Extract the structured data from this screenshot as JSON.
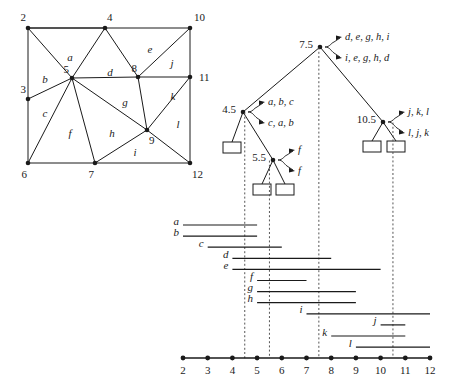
{
  "chart_data": {
    "type": "diagram",
    "xlabel": "",
    "ylabel": "",
    "axis": {
      "min": 2,
      "max": 12,
      "ticks": [
        2,
        3,
        4,
        5,
        6,
        7,
        8,
        9,
        10,
        11,
        12
      ],
      "tick_labels": [
        "2",
        "3",
        "4",
        "5",
        "6",
        "7",
        "8",
        "9",
        "10",
        "11",
        "12"
      ]
    },
    "intervals": [
      {
        "name": "a",
        "start": 2,
        "end": 5,
        "label_side": "left"
      },
      {
        "name": "b",
        "start": 2,
        "end": 5,
        "label_side": "left"
      },
      {
        "name": "c",
        "start": 3,
        "end": 6,
        "label_side": "left"
      },
      {
        "name": "d",
        "start": 4,
        "end": 8,
        "label_side": "left"
      },
      {
        "name": "e",
        "start": 4,
        "end": 10,
        "label_side": "left"
      },
      {
        "name": "f",
        "start": 5,
        "end": 7,
        "label_side": "left"
      },
      {
        "name": "g",
        "start": 5,
        "end": 9,
        "label_side": "left"
      },
      {
        "name": "h",
        "start": 5,
        "end": 9,
        "label_side": "left"
      },
      {
        "name": "i",
        "start": 7,
        "end": 12,
        "label_side": "left"
      },
      {
        "name": "j",
        "start": 10,
        "end": 11,
        "label_side": "left"
      },
      {
        "name": "k",
        "start": 8,
        "end": 11,
        "label_side": "left"
      },
      {
        "name": "l",
        "start": 9,
        "end": 12,
        "label_side": "left"
      }
    ],
    "split_lines": [
      4.5,
      5.5,
      7.5,
      10.5
    ]
  },
  "subdivision": {
    "vertex_labels": [
      "2",
      "4",
      "10",
      "11",
      "3",
      "5",
      "8",
      "6",
      "7",
      "9",
      "12"
    ],
    "vertices": [
      {
        "id": "2",
        "label": "2",
        "x": 28,
        "y": 28
      },
      {
        "id": "4",
        "label": "4",
        "x": 105,
        "y": 28
      },
      {
        "id": "10",
        "label": "10",
        "x": 190,
        "y": 28
      },
      {
        "id": "3",
        "label": "3",
        "x": 28,
        "y": 99
      },
      {
        "id": "5",
        "label": "5",
        "x": 72,
        "y": 78
      },
      {
        "id": "8",
        "label": "8",
        "x": 138,
        "y": 77
      },
      {
        "id": "11",
        "label": "11",
        "x": 190,
        "y": 77
      },
      {
        "id": "6",
        "label": "6",
        "x": 28,
        "y": 163
      },
      {
        "id": "7",
        "label": "7",
        "x": 95,
        "y": 163
      },
      {
        "id": "9",
        "label": "9",
        "x": 147,
        "y": 130
      },
      {
        "id": "12",
        "label": "12",
        "x": 190,
        "y": 163
      }
    ],
    "faces": [
      {
        "label": "a",
        "x": 70,
        "y": 57
      },
      {
        "label": "b",
        "x": 45,
        "y": 79
      },
      {
        "label": "c",
        "x": 45,
        "y": 113
      },
      {
        "label": "d",
        "x": 110,
        "y": 72
      },
      {
        "label": "e",
        "x": 150,
        "y": 49
      },
      {
        "label": "f",
        "x": 70,
        "y": 133
      },
      {
        "label": "g",
        "x": 125,
        "y": 102
      },
      {
        "label": "h",
        "x": 112,
        "y": 133
      },
      {
        "label": "i",
        "x": 135,
        "y": 152
      },
      {
        "label": "j",
        "x": 172,
        "y": 63
      },
      {
        "label": "k",
        "x": 173,
        "y": 96
      },
      {
        "label": "l",
        "x": 178,
        "y": 124
      }
    ]
  },
  "tree": {
    "nodes": [
      {
        "id": "root",
        "key": "7.5",
        "x": 320,
        "y": 47,
        "key_pos": "left",
        "sets": [
          "d, e, g, h, i",
          "i, e, g, h, d"
        ],
        "type": "internal"
      },
      {
        "id": "left",
        "key": "4.5",
        "x": 243,
        "y": 112,
        "key_pos": "left",
        "sets": [
          "a, b, c",
          "c, a, b"
        ],
        "type": "internal"
      },
      {
        "id": "mid",
        "key": "5.5",
        "x": 273,
        "y": 160,
        "key_pos": "left",
        "sets": [
          "f",
          "f"
        ],
        "type": "internal"
      },
      {
        "id": "right",
        "key": "10.5",
        "x": 383,
        "y": 122,
        "key_pos": "left",
        "sets": [
          "j, k, l",
          "l, j, k"
        ],
        "type": "internal"
      }
    ],
    "leaves": [
      {
        "id": "leaf1",
        "x": 232,
        "y": 148
      },
      {
        "id": "leaf2",
        "x": 262,
        "y": 190
      },
      {
        "id": "leaf3",
        "x": 285,
        "y": 190
      },
      {
        "id": "leaf4",
        "x": 372,
        "y": 147
      },
      {
        "id": "leaf5",
        "x": 396,
        "y": 147
      }
    ],
    "edges": [
      {
        "from": "root",
        "to": "left"
      },
      {
        "from": "root",
        "to": "right"
      },
      {
        "from": "left",
        "to": "leaf1"
      },
      {
        "from": "left",
        "to": "mid"
      },
      {
        "from": "mid",
        "to": "leaf2"
      },
      {
        "from": "mid",
        "to": "leaf3"
      },
      {
        "from": "right",
        "to": "leaf4"
      },
      {
        "from": "right",
        "to": "leaf5"
      }
    ]
  },
  "colors": {
    "ink": "#1a1a1a",
    "guide": "#555555",
    "background": "#ffffff"
  }
}
